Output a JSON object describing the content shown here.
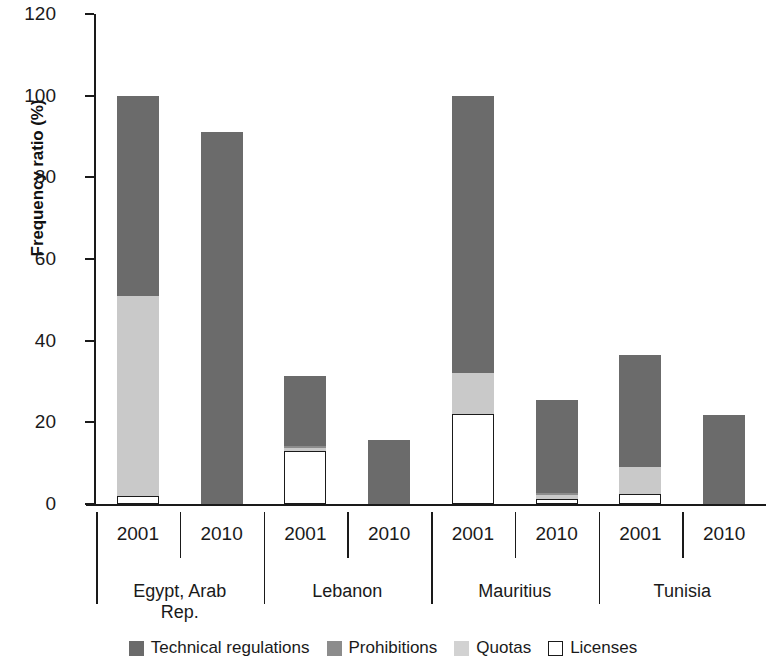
{
  "chart_data": {
    "type": "bar",
    "stacked": true,
    "title": "",
    "xlabel": "",
    "ylabel": "Frequency ratio (%)",
    "ylim": [
      0,
      120
    ],
    "yticks": [
      0,
      20,
      40,
      60,
      80,
      100,
      120
    ],
    "ytick_labels": [
      "0",
      "20",
      "40",
      "60",
      "80",
      "100",
      "120"
    ],
    "grid": false,
    "legend_position": "bottom",
    "groups": [
      "Egypt, Arab Rep.",
      "Lebanon",
      "Mauritius",
      "Tunisia"
    ],
    "group_labels": [
      {
        "line1": "Egypt, Arab",
        "line2": "Rep."
      },
      {
        "line1": "Lebanon",
        "line2": ""
      },
      {
        "line1": "Mauritius",
        "line2": ""
      },
      {
        "line1": "Tunisia",
        "line2": ""
      }
    ],
    "categories": [
      "2001",
      "2010",
      "2001",
      "2010",
      "2001",
      "2010",
      "2001",
      "2010"
    ],
    "series": [
      {
        "name": "Technical regulations",
        "color": "#6b6b6b",
        "values": [
          49.0,
          91.0,
          17.0,
          15.7,
          68.0,
          23.0,
          27.5,
          21.8
        ]
      },
      {
        "name": "Prohibitions",
        "color": "#8c8c8c",
        "values": [
          0.0,
          0.0,
          0.7,
          0.0,
          0.0,
          0.5,
          0.0,
          0.0
        ]
      },
      {
        "name": "Quotas",
        "color": "#c9c9c9",
        "values": [
          49.0,
          0.0,
          0.6,
          0.0,
          10.0,
          0.9,
          6.5,
          0.0
        ]
      },
      {
        "name": "Licenses",
        "color": "#ffffff",
        "values": [
          2.0,
          0.0,
          13.0,
          0.0,
          22.0,
          1.2,
          2.5,
          0.0
        ]
      }
    ],
    "totals": [
      100.0,
      91.0,
      31.3,
      15.7,
      100.0,
      25.6,
      36.5,
      21.8
    ]
  },
  "legend": {
    "items": [
      {
        "label": "Technical regulations",
        "swatch": "dark-gray"
      },
      {
        "label": "Prohibitions",
        "swatch": "medium-gray"
      },
      {
        "label": "Quotas",
        "swatch": "light-gray"
      },
      {
        "label": "Licenses",
        "swatch": "white-outline"
      }
    ]
  },
  "colors": {
    "technical_regulations": "#6b6b6b",
    "prohibitions": "#8c8c8c",
    "quotas": "#c9c9c9",
    "licenses": "#ffffff",
    "axis": "#1a1a1a",
    "background": "#ffffff"
  }
}
